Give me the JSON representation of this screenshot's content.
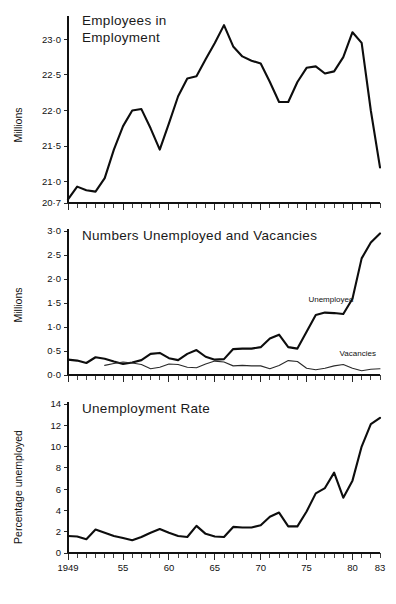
{
  "figure": {
    "background": "#ffffff",
    "ink_color": "#111111"
  },
  "chart_data": [
    {
      "id": "employees-in-employment",
      "type": "line",
      "title": "Employees in",
      "title_line2": "Employment",
      "xlabel": "",
      "ylabel": "Millions",
      "xlim": [
        1949,
        1983
      ],
      "ylim": [
        20.7,
        23.3
      ],
      "grid": false,
      "legend": "none",
      "ytick_labels": [
        "23·0",
        "22·5",
        "22·0",
        "21·5",
        "21·0",
        "20·7"
      ],
      "ytick_values": [
        23.0,
        22.5,
        22.0,
        21.5,
        21.0,
        20.7
      ],
      "xtick_labels": [
        "1949",
        "55",
        "60",
        "65",
        "70",
        "75",
        "80",
        "83"
      ],
      "xtick_values": [
        1949,
        1955,
        1960,
        1965,
        1970,
        1975,
        1980,
        1983
      ],
      "x": [
        1949,
        1950,
        1951,
        1952,
        1953,
        1954,
        1955,
        1956,
        1957,
        1958,
        1959,
        1960,
        1961,
        1962,
        1963,
        1964,
        1965,
        1966,
        1967,
        1968,
        1969,
        1970,
        1971,
        1972,
        1973,
        1974,
        1975,
        1976,
        1977,
        1978,
        1979,
        1980,
        1981,
        1982,
        1983
      ],
      "series": [
        {
          "name": "Employees in Employment",
          "values": [
            20.75,
            20.93,
            20.88,
            20.86,
            21.05,
            21.45,
            21.78,
            22.0,
            22.02,
            21.75,
            21.45,
            21.82,
            22.2,
            22.45,
            22.48,
            22.72,
            22.95,
            23.2,
            22.9,
            22.76,
            22.7,
            22.66,
            22.4,
            22.12,
            22.12,
            22.4,
            22.6,
            22.62,
            22.52,
            22.55,
            22.75,
            23.1,
            22.95,
            22.0,
            21.2
          ]
        }
      ]
    },
    {
      "id": "numbers-unemployed-and-vacancies",
      "type": "line",
      "title": "Numbers Unemployed and Vacancies",
      "xlabel": "",
      "ylabel": "Millions",
      "xlim": [
        1949,
        1983
      ],
      "ylim": [
        0.0,
        3.0
      ],
      "grid": false,
      "legend": "inline-annotations",
      "ytick_labels": [
        "3·0",
        "2·5",
        "2·0",
        "1·5",
        "1·0",
        "0·5",
        "0·0"
      ],
      "ytick_values": [
        3.0,
        2.5,
        2.0,
        1.5,
        1.0,
        0.5,
        0.0
      ],
      "xtick_labels": [
        "1949",
        "55",
        "60",
        "65",
        "70",
        "75",
        "80",
        "83"
      ],
      "xtick_values": [
        1949,
        1955,
        1960,
        1965,
        1970,
        1975,
        1980,
        1983
      ],
      "x": [
        1949,
        1950,
        1951,
        1952,
        1953,
        1954,
        1955,
        1956,
        1957,
        1958,
        1959,
        1960,
        1961,
        1962,
        1963,
        1964,
        1965,
        1966,
        1967,
        1968,
        1969,
        1970,
        1971,
        1972,
        1973,
        1974,
        1975,
        1976,
        1977,
        1978,
        1979,
        1980,
        1981,
        1982,
        1983
      ],
      "series": [
        {
          "name": "Unemployed",
          "label": "Unemployed",
          "label_x": 1975.2,
          "label_y": 1.52,
          "style": "thick",
          "values": [
            0.32,
            0.3,
            0.25,
            0.37,
            0.34,
            0.28,
            0.23,
            0.26,
            0.31,
            0.44,
            0.46,
            0.35,
            0.31,
            0.44,
            0.52,
            0.38,
            0.32,
            0.33,
            0.54,
            0.55,
            0.55,
            0.58,
            0.76,
            0.84,
            0.58,
            0.55,
            0.9,
            1.25,
            1.3,
            1.29,
            1.27,
            1.59,
            2.43,
            2.76,
            2.95
          ]
        },
        {
          "name": "Vacancies",
          "label": "Vacancies",
          "label_x": 1978.6,
          "label_y": 0.39,
          "style": "thin",
          "values": [
            null,
            null,
            null,
            null,
            0.2,
            0.24,
            0.27,
            0.25,
            0.22,
            0.13,
            0.16,
            0.23,
            0.22,
            0.16,
            0.15,
            0.23,
            0.29,
            0.27,
            0.19,
            0.2,
            0.19,
            0.19,
            0.13,
            0.2,
            0.3,
            0.28,
            0.14,
            0.11,
            0.14,
            0.19,
            0.22,
            0.14,
            0.09,
            0.12,
            0.13
          ]
        }
      ]
    },
    {
      "id": "unemployment-rate",
      "type": "line",
      "title": "Unemployment Rate",
      "xlabel": "",
      "ylabel": "Percentage unemployed",
      "xlim": [
        1949,
        1983
      ],
      "ylim": [
        0,
        14
      ],
      "grid": false,
      "legend": "none",
      "ytick_labels": [
        "14",
        "12",
        "10",
        "8",
        "6",
        "4",
        "2",
        "0"
      ],
      "ytick_values": [
        14,
        12,
        10,
        8,
        6,
        4,
        2,
        0
      ],
      "xtick_labels": [
        "1949",
        "55",
        "60",
        "65",
        "70",
        "75",
        "80",
        "83"
      ],
      "xtick_values": [
        1949,
        1955,
        1960,
        1965,
        1970,
        1975,
        1980,
        1983
      ],
      "x": [
        1949,
        1950,
        1951,
        1952,
        1953,
        1954,
        1955,
        1956,
        1957,
        1958,
        1959,
        1960,
        1961,
        1962,
        1963,
        1964,
        1965,
        1966,
        1967,
        1968,
        1969,
        1970,
        1971,
        1972,
        1973,
        1974,
        1975,
        1976,
        1977,
        1978,
        1979,
        1980,
        1981,
        1982,
        1983
      ],
      "series": [
        {
          "name": "Percentage unemployed",
          "style": "thick",
          "values": [
            1.6,
            1.55,
            1.3,
            2.2,
            1.9,
            1.6,
            1.4,
            1.2,
            1.5,
            1.9,
            2.25,
            1.9,
            1.6,
            1.5,
            2.55,
            1.8,
            1.55,
            1.5,
            2.45,
            2.4,
            2.4,
            2.6,
            3.4,
            3.8,
            2.5,
            2.5,
            3.9,
            5.6,
            6.1,
            7.55,
            5.2,
            6.8,
            10.0,
            12.1,
            12.7
          ]
        }
      ]
    }
  ]
}
